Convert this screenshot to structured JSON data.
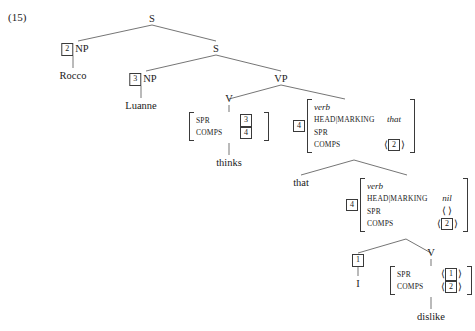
{
  "example": {
    "label": "(15)"
  },
  "tree": {
    "nodes": {
      "s_top": "S",
      "s_mid": "S",
      "np_rocco": "NP",
      "np_luanne": "NP",
      "vp": "VP",
      "v_thinks": "V",
      "v_dislike": "V",
      "comp_that": "that"
    },
    "tags": {
      "rocco": "2",
      "luanne": "3",
      "thinks_spr": "3",
      "thinks_comps": "4",
      "vp_matrix": "4",
      "lower_matrix": "4",
      "subject_i": "1",
      "dislike_spr": "1",
      "dislike_comps": "2",
      "vp_comps_item": "2",
      "lower_comps_item": "2"
    },
    "words": {
      "rocco": "Rocco",
      "luanne": "Luanne",
      "thinks": "thinks",
      "i": "I",
      "dislike": "dislike"
    }
  },
  "matrices": {
    "thinks": {
      "rows": [
        {
          "feature": "SPR",
          "value_tag": "3"
        },
        {
          "feature": "COMPS",
          "value_tag": "4"
        }
      ]
    },
    "vp_complement": {
      "tag": "4",
      "type": "verb",
      "rows": [
        {
          "feature": "HEAD|MARKING",
          "value": "that",
          "italic": true
        },
        {
          "feature": "SPR",
          "value": "⟨ ⟩"
        },
        {
          "feature": "COMPS",
          "value_tag": "2",
          "bracketed": true
        }
      ]
    },
    "lower_clause": {
      "tag": "4",
      "type": "verb",
      "rows": [
        {
          "feature": "HEAD|MARKING",
          "value": "nil",
          "italic": true
        },
        {
          "feature": "SPR",
          "value": "⟨ ⟩"
        },
        {
          "feature": "COMPS",
          "value_tag": "2",
          "bracketed": true
        }
      ]
    },
    "dislike": {
      "rows": [
        {
          "feature": "SPR",
          "value_tag": "1",
          "bracketed": true
        },
        {
          "feature": "COMPS",
          "value_tag": "2",
          "bracketed": true
        }
      ]
    }
  },
  "brackets": {
    "open": "⟨",
    "close": "⟩"
  },
  "colors": {
    "ink": "#1a1a1a",
    "line": "#3a3a3a",
    "background": "#ffffff"
  }
}
